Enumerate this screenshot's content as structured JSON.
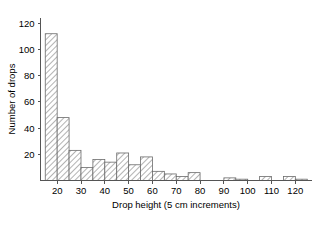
{
  "chart_data": {
    "type": "bar",
    "title": "",
    "xlabel": "Drop height (5 cm increments)",
    "ylabel": "Number of drops",
    "xlim": [
      13,
      127
    ],
    "ylim": [
      0,
      124
    ],
    "grid": false,
    "legend": null,
    "bin_width": 5,
    "xticks": [
      20,
      30,
      40,
      50,
      60,
      70,
      80,
      90,
      100,
      110,
      120
    ],
    "yticks": [
      20,
      40,
      60,
      80,
      100,
      120
    ],
    "bins": [
      {
        "start": 15,
        "end": 20,
        "center": 17.5,
        "value": 112
      },
      {
        "start": 20,
        "end": 25,
        "center": 22.5,
        "value": 48
      },
      {
        "start": 25,
        "end": 30,
        "center": 27.5,
        "value": 23
      },
      {
        "start": 30,
        "end": 35,
        "center": 32.5,
        "value": 10
      },
      {
        "start": 35,
        "end": 40,
        "center": 37.5,
        "value": 16
      },
      {
        "start": 40,
        "end": 45,
        "center": 42.5,
        "value": 14
      },
      {
        "start": 45,
        "end": 50,
        "center": 47.5,
        "value": 21
      },
      {
        "start": 50,
        "end": 55,
        "center": 52.5,
        "value": 12
      },
      {
        "start": 55,
        "end": 60,
        "center": 57.5,
        "value": 18
      },
      {
        "start": 60,
        "end": 65,
        "center": 62.5,
        "value": 7
      },
      {
        "start": 65,
        "end": 70,
        "center": 67.5,
        "value": 5
      },
      {
        "start": 70,
        "end": 75,
        "center": 72.5,
        "value": 3
      },
      {
        "start": 75,
        "end": 80,
        "center": 77.5,
        "value": 6
      },
      {
        "start": 80,
        "end": 85,
        "center": 82.5,
        "value": 0
      },
      {
        "start": 85,
        "end": 90,
        "center": 87.5,
        "value": 0
      },
      {
        "start": 90,
        "end": 95,
        "center": 92.5,
        "value": 2
      },
      {
        "start": 95,
        "end": 100,
        "center": 97.5,
        "value": 1
      },
      {
        "start": 100,
        "end": 105,
        "center": 102.5,
        "value": 0
      },
      {
        "start": 105,
        "end": 110,
        "center": 107.5,
        "value": 3
      },
      {
        "start": 110,
        "end": 115,
        "center": 112.5,
        "value": 0
      },
      {
        "start": 115,
        "end": 120,
        "center": 117.5,
        "value": 3
      },
      {
        "start": 120,
        "end": 125,
        "center": 122.5,
        "value": 1
      }
    ],
    "colors": {
      "bar_edge": "#6b6b6b",
      "bar_hatch": "#8a8a8a",
      "axis": "#555555",
      "text": "#000000",
      "background": "#ffffff"
    }
  }
}
